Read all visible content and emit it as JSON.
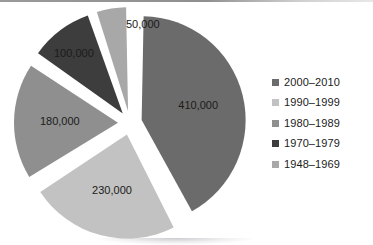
{
  "chart_data": {
    "type": "pie",
    "title": "",
    "subtitle": "",
    "xlabel": "",
    "ylabel": "",
    "total": 970000,
    "start_angle_deg": 0,
    "direction": "clockwise",
    "exploded": true,
    "legend_position": "right",
    "grid": false,
    "categories": [
      "2000–2010",
      "1990–1999",
      "1980–1989",
      "1970–1979",
      "1948–1969"
    ],
    "values": [
      410000,
      230000,
      180000,
      100000,
      50000
    ],
    "data_labels": [
      "410,000",
      "230,000",
      "180,000",
      "100,000",
      "50,000"
    ],
    "colors": [
      "#6b6b6b",
      "#c2c2c2",
      "#8f8f8f",
      "#3d3d3d",
      "#a8a8a8"
    ],
    "slices": [
      {
        "label": "410,000",
        "value": 410000,
        "category": "2000–2010",
        "color": "#6b6b6b",
        "angle_deg": 152.2,
        "label_inside": true
      },
      {
        "label": "230,000",
        "value": 230000,
        "category": "1990–1999",
        "color": "#c2c2c2",
        "angle_deg": 85.4,
        "label_inside": true
      },
      {
        "label": "180,000",
        "value": 180000,
        "category": "1980–1989",
        "color": "#8f8f8f",
        "angle_deg": 66.8,
        "label_inside": true
      },
      {
        "label": "100,000",
        "value": 100000,
        "category": "1970–1979",
        "color": "#3d3d3d",
        "angle_deg": 37.1,
        "label_inside": false
      },
      {
        "label": "50,000",
        "value": 50000,
        "category": "1948–1969",
        "color": "#a8a8a8",
        "angle_deg": 18.6,
        "label_inside": false
      }
    ]
  },
  "legend": {
    "items": [
      {
        "label": "2000–2010",
        "color": "#6b6b6b",
        "marker": "square-marker"
      },
      {
        "label": "1990–1999",
        "color": "#c2c2c2",
        "marker": "square-marker"
      },
      {
        "label": "1980–1989",
        "color": "#8f8f8f",
        "marker": "square-marker"
      },
      {
        "label": "1970–1979",
        "color": "#3d3d3d",
        "marker": "square-marker"
      },
      {
        "label": "1948–1969",
        "color": "#a8a8a8",
        "marker": "square-marker"
      }
    ]
  },
  "labels": {
    "outside": [
      {
        "text": "50,000",
        "x": 120,
        "y": 16
      },
      {
        "text": "100,000",
        "x": 48,
        "y": 45
      }
    ],
    "inside": [
      {
        "text": "410,000",
        "x": 187,
        "y": 113
      },
      {
        "text": "230,000",
        "x": 117,
        "y": 197
      },
      {
        "text": "180,000",
        "x": 73,
        "y": 122
      }
    ]
  }
}
